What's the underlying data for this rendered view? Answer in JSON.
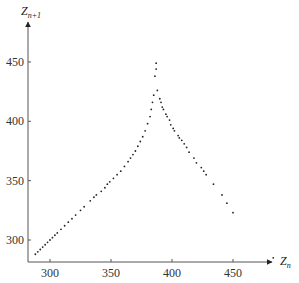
{
  "chart_data": {
    "type": "scatter",
    "title": "",
    "xlabel": "Z_n",
    "ylabel": "Z_{n+1}",
    "xlabel_main": "Z",
    "xlabel_sub": "n",
    "ylabel_main": "Z",
    "ylabel_sub": "n+1",
    "xlim": [
      282,
      490
    ],
    "ylim": [
      282,
      465
    ],
    "x_ticks": [
      300,
      350,
      400,
      450
    ],
    "y_ticks": [
      300,
      350,
      400,
      450
    ],
    "grid": false,
    "legend": null,
    "series": [
      {
        "name": "Lorenz map (successive maxima)",
        "points": [
          [
            288,
            288
          ],
          [
            290,
            290
          ],
          [
            292,
            292
          ],
          [
            294,
            294
          ],
          [
            296,
            296
          ],
          [
            298,
            298
          ],
          [
            300,
            300
          ],
          [
            302,
            302
          ],
          [
            304,
            304
          ],
          [
            306,
            306
          ],
          [
            309,
            309
          ],
          [
            312,
            312
          ],
          [
            315,
            315
          ],
          [
            318,
            318
          ],
          [
            321,
            321
          ],
          [
            325,
            325
          ],
          [
            328,
            328
          ],
          [
            333,
            333
          ],
          [
            336,
            336
          ],
          [
            338,
            338
          ],
          [
            342,
            341
          ],
          [
            345,
            344
          ],
          [
            347,
            347
          ],
          [
            349,
            349
          ],
          [
            352,
            352
          ],
          [
            355,
            355
          ],
          [
            358,
            358
          ],
          [
            361,
            362
          ],
          [
            364,
            366
          ],
          [
            366,
            369
          ],
          [
            368,
            372
          ],
          [
            370,
            375
          ],
          [
            372,
            379
          ],
          [
            374,
            383
          ],
          [
            376,
            387
          ],
          [
            378,
            392
          ],
          [
            380,
            398
          ],
          [
            382,
            404
          ],
          [
            383,
            410
          ],
          [
            384,
            416
          ],
          [
            385,
            422
          ],
          [
            386,
            438
          ],
          [
            387,
            444
          ],
          [
            387,
            449
          ],
          [
            388,
            426
          ],
          [
            390,
            419
          ],
          [
            391,
            416
          ],
          [
            392,
            412
          ],
          [
            393,
            410
          ],
          [
            395,
            406
          ],
          [
            396,
            404
          ],
          [
            398,
            401
          ],
          [
            399,
            397
          ],
          [
            401,
            394
          ],
          [
            402,
            392
          ],
          [
            405,
            388
          ],
          [
            406,
            386
          ],
          [
            408,
            384
          ],
          [
            410,
            381
          ],
          [
            412,
            378
          ],
          [
            414,
            374
          ],
          [
            418,
            369
          ],
          [
            420,
            365
          ],
          [
            424,
            361
          ],
          [
            426,
            358
          ],
          [
            428,
            355
          ],
          [
            434,
            347
          ],
          [
            441,
            338
          ],
          [
            445,
            331
          ],
          [
            450,
            323
          ],
          [
            483,
            285
          ]
        ]
      }
    ]
  }
}
